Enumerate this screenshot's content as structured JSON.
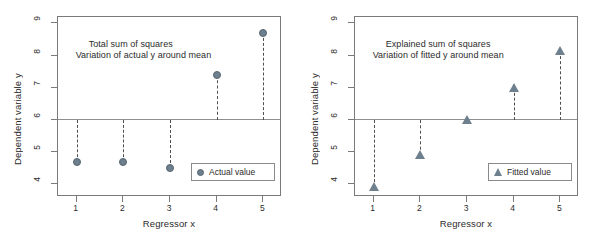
{
  "figure": {
    "width": 594,
    "height": 238,
    "background": "#ffffff",
    "marker_color": "#6e7f8d",
    "axis_color": "#7a7a7a",
    "mean_line_color": "#8f8f8f",
    "stem_color": "#4f4f4f",
    "text_color": "#2b2b2b"
  },
  "chart_data": [
    {
      "type": "scatter",
      "panel": "left",
      "title": "",
      "annotations": [
        "Total sum of squares",
        "Variation of actual y around mean"
      ],
      "xlabel": "Regressor x",
      "ylabel": "Dependent variable y",
      "xlim": [
        0.6,
        5.4
      ],
      "ylim": [
        3.6,
        9.2
      ],
      "xticks": [
        1,
        2,
        3,
        4,
        5
      ],
      "xticklabels": [
        "1",
        "2",
        "3",
        "4",
        "5"
      ],
      "yticks": [
        4,
        5,
        6,
        7,
        8,
        9
      ],
      "yticklabels": [
        "4",
        "5",
        "6",
        "7",
        "8",
        "9"
      ],
      "grid": false,
      "reference_line": {
        "orientation": "horizontal",
        "y": 6.0,
        "label": "mean"
      },
      "series": [
        {
          "name": "Actual value",
          "marker": "circle",
          "x": [
            1,
            2,
            3,
            4,
            5
          ],
          "values": [
            4.7,
            4.7,
            4.5,
            7.4,
            8.7
          ],
          "stems_to": 6.0
        }
      ],
      "legend": {
        "position": "lower right",
        "entries": [
          "Actual value"
        ]
      }
    },
    {
      "type": "scatter",
      "panel": "right",
      "title": "",
      "annotations": [
        "Explained sum of squares",
        "Variation of fitted y around mean"
      ],
      "xlabel": "Regressor x",
      "ylabel": "Dependent variable y",
      "xlim": [
        0.6,
        5.4
      ],
      "ylim": [
        3.6,
        9.2
      ],
      "xticks": [
        1,
        2,
        3,
        4,
        5
      ],
      "xticklabels": [
        "1",
        "2",
        "3",
        "4",
        "5"
      ],
      "yticks": [
        4,
        5,
        6,
        7,
        8,
        9
      ],
      "yticklabels": [
        "4",
        "5",
        "6",
        "7",
        "8",
        "9"
      ],
      "grid": false,
      "reference_line": {
        "orientation": "horizontal",
        "y": 6.0,
        "label": "mean"
      },
      "series": [
        {
          "name": "Fitted value",
          "marker": "triangle",
          "x": [
            1,
            2,
            3,
            4,
            5
          ],
          "values": [
            3.9,
            4.9,
            6.0,
            7.0,
            8.15
          ],
          "stems_to": 6.0
        }
      ],
      "legend": {
        "position": "lower right",
        "entries": [
          "Fitted value"
        ]
      }
    }
  ]
}
